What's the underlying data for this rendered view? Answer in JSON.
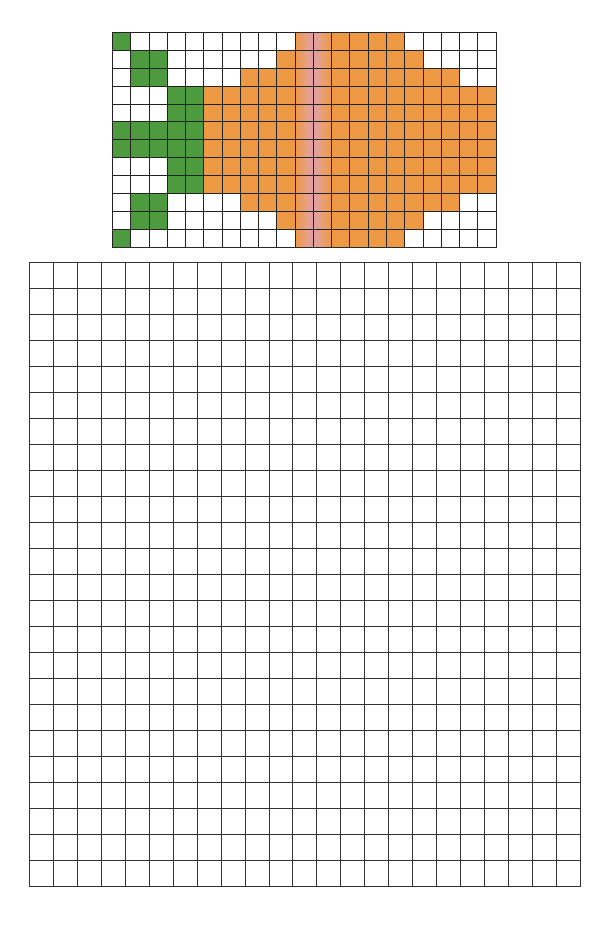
{
  "reference_pattern": {
    "columns": 21,
    "rows": 12,
    "palette": {
      "W": "#ffffff",
      "G": "#4e9a3f",
      "O": "#ee9a45",
      "P1": "linear-gradient(90deg, #ee9a45 0%, #e6a08c 70%, #dea0a8 100%)",
      "P2": "linear-gradient(90deg, #dea0a8 0%, #e6a08c 30%, #ee9a45 100%)"
    },
    "cells": [
      [
        "G",
        "W",
        "W",
        "W",
        "W",
        "W",
        "W",
        "W",
        "W",
        "W",
        "P1",
        "P2",
        "O",
        "O",
        "O",
        "O",
        "W",
        "W",
        "W",
        "W",
        "W"
      ],
      [
        "W",
        "G",
        "G",
        "W",
        "W",
        "W",
        "W",
        "W",
        "W",
        "O",
        "P1",
        "P2",
        "O",
        "O",
        "O",
        "O",
        "O",
        "W",
        "W",
        "W",
        "W"
      ],
      [
        "W",
        "G",
        "G",
        "W",
        "W",
        "W",
        "W",
        "O",
        "O",
        "O",
        "P1",
        "P2",
        "O",
        "O",
        "O",
        "O",
        "O",
        "O",
        "O",
        "W",
        "W"
      ],
      [
        "W",
        "W",
        "W",
        "G",
        "G",
        "O",
        "O",
        "O",
        "O",
        "O",
        "P1",
        "P2",
        "O",
        "O",
        "O",
        "O",
        "O",
        "O",
        "O",
        "O",
        "O"
      ],
      [
        "W",
        "W",
        "W",
        "G",
        "G",
        "O",
        "O",
        "O",
        "O",
        "O",
        "P1",
        "P2",
        "O",
        "O",
        "O",
        "O",
        "O",
        "O",
        "O",
        "O",
        "O"
      ],
      [
        "G",
        "G",
        "G",
        "G",
        "G",
        "O",
        "O",
        "O",
        "O",
        "O",
        "P1",
        "P2",
        "O",
        "O",
        "O",
        "O",
        "O",
        "O",
        "O",
        "O",
        "O"
      ],
      [
        "G",
        "G",
        "G",
        "G",
        "G",
        "O",
        "O",
        "O",
        "O",
        "O",
        "P1",
        "P2",
        "O",
        "O",
        "O",
        "O",
        "O",
        "O",
        "O",
        "O",
        "O"
      ],
      [
        "W",
        "W",
        "W",
        "G",
        "G",
        "O",
        "O",
        "O",
        "O",
        "O",
        "P1",
        "P2",
        "O",
        "O",
        "O",
        "O",
        "O",
        "O",
        "O",
        "O",
        "O"
      ],
      [
        "W",
        "W",
        "W",
        "G",
        "G",
        "O",
        "O",
        "O",
        "O",
        "O",
        "P1",
        "P2",
        "O",
        "O",
        "O",
        "O",
        "O",
        "O",
        "O",
        "O",
        "O"
      ],
      [
        "W",
        "G",
        "G",
        "W",
        "W",
        "W",
        "W",
        "O",
        "O",
        "O",
        "P1",
        "P2",
        "O",
        "O",
        "O",
        "O",
        "O",
        "O",
        "O",
        "W",
        "W"
      ],
      [
        "W",
        "G",
        "G",
        "W",
        "W",
        "W",
        "W",
        "W",
        "W",
        "O",
        "P1",
        "P2",
        "O",
        "O",
        "O",
        "O",
        "O",
        "W",
        "W",
        "W",
        "W"
      ],
      [
        "G",
        "W",
        "W",
        "W",
        "W",
        "W",
        "W",
        "W",
        "W",
        "W",
        "P1",
        "P2",
        "O",
        "O",
        "O",
        "O",
        "W",
        "W",
        "W",
        "W",
        "W"
      ]
    ]
  },
  "drawing_grid": {
    "columns": 23,
    "rows": 24,
    "fill": "#ffffff"
  }
}
